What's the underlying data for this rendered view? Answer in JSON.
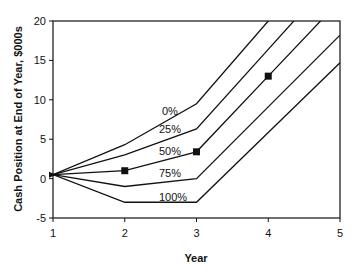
{
  "chart_data": {
    "type": "line",
    "title": "",
    "xlabel": "Year",
    "ylabel": "Cash Position at End of Year, $000s",
    "xlim": [
      1,
      5
    ],
    "ylim": [
      -5,
      20
    ],
    "x_ticks": [
      "1",
      "2",
      "3",
      "4",
      "5"
    ],
    "y_ticks": [
      "20",
      "15",
      "10",
      "5",
      "0",
      "-5"
    ],
    "grid": false,
    "legend": "inline labels",
    "series": [
      {
        "name": "0%",
        "x": [
          1,
          2,
          3,
          4,
          5
        ],
        "values": [
          0.5,
          4.3,
          9.5,
          20.0,
          30.5
        ]
      },
      {
        "name": "25%",
        "x": [
          1,
          2,
          3,
          4,
          5
        ],
        "values": [
          0.5,
          3.0,
          6.3,
          16.4,
          26.5
        ]
      },
      {
        "name": "50%",
        "x": [
          1,
          2,
          3,
          4,
          5
        ],
        "values": [
          0.5,
          1.0,
          3.4,
          13.0,
          22.6
        ]
      },
      {
        "name": "75%",
        "x": [
          1,
          2,
          3,
          4,
          5
        ],
        "values": [
          0.5,
          -1.0,
          0.0,
          9.1,
          18.2
        ]
      },
      {
        "name": "100%",
        "x": [
          1,
          2,
          3,
          4,
          5
        ],
        "values": [
          0.5,
          -3.0,
          -3.0,
          5.85,
          14.7
        ]
      }
    ],
    "markers": [
      {
        "x": 1,
        "y": 0.5,
        "shape": "triangle"
      },
      {
        "x": 2,
        "y": 1.0,
        "shape": "square"
      },
      {
        "x": 3,
        "y": 3.4,
        "shape": "square"
      },
      {
        "x": 4,
        "y": 13.0,
        "shape": "square"
      }
    ]
  },
  "labels": {
    "xlabel": "Year",
    "ylabel": "Cash Position at End of Year, $000s",
    "x_ticks": [
      "1",
      "2",
      "3",
      "4",
      "5"
    ],
    "y_ticks": [
      "20",
      "15",
      "10",
      "5",
      "0",
      "-5"
    ],
    "series": [
      "0%",
      "25%",
      "50%",
      "75%",
      "100%"
    ]
  }
}
